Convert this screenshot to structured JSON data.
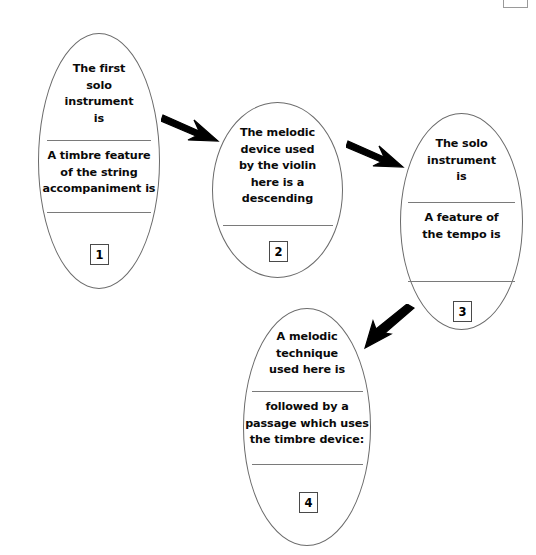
{
  "diagram": {
    "type": "flowchart",
    "orientation": "left-to-right-then-down",
    "nodes": [
      {
        "number": "1",
        "prompt_top": "The first\nsolo\ninstrument\nis",
        "prompt_bottom": "A timbre feature\nof the string\naccompaniment is",
        "blank_lines": 2
      },
      {
        "number": "2",
        "prompt_top": "The melodic\ndevice used\nby the violin\nhere is a\ndescending",
        "prompt_bottom": "",
        "blank_lines": 1
      },
      {
        "number": "3",
        "prompt_top": "The solo\ninstrument\nis",
        "prompt_bottom": "A feature of\nthe tempo is",
        "blank_lines": 2
      },
      {
        "number": "4",
        "prompt_top": "A melodic\ntechnique\nused here is",
        "prompt_bottom": "followed by a\npassage which uses\nthe timbre device:",
        "blank_lines": 2
      }
    ],
    "connectors": [
      {
        "name": "arrow-1-to-2",
        "direction": "right-down"
      },
      {
        "name": "arrow-2-to-3",
        "direction": "right-down"
      },
      {
        "name": "arrow-3-to-4",
        "direction": "down-left"
      }
    ],
    "colors": {
      "stroke": "#6b6b6b",
      "text": "#0a0a0a",
      "arrow": "#000000",
      "background": "#ffffff"
    }
  }
}
